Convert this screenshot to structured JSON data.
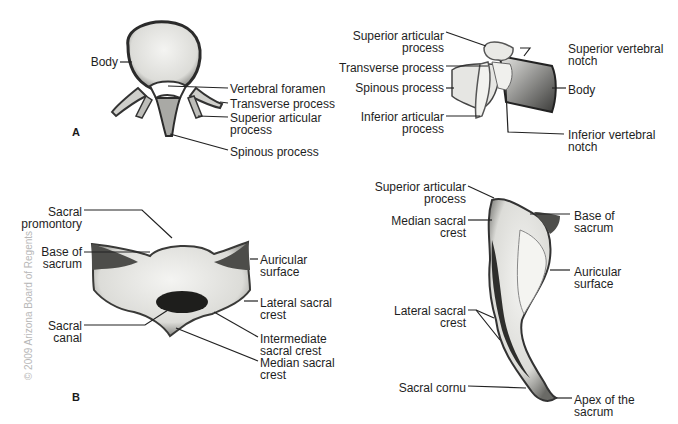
{
  "copyright": "© 2009 Arizona Board of Regents",
  "panels": {
    "a": "A",
    "b": "B"
  },
  "vertebra_superior": {
    "labels": [
      "Body",
      "Vertebral foramen",
      "Transverse process",
      "Superior articular",
      "process",
      "Spinous process"
    ]
  },
  "vertebra_lateral": {
    "labels": [
      "Superior articular",
      "process",
      "Transverse process",
      "Spinous process",
      "Inferior articular",
      "process",
      "Superior vertebral",
      "notch",
      "Body",
      "Inferior vertebral",
      "notch"
    ]
  },
  "sacrum_anterior": {
    "labels": [
      "Sacral",
      "promontory",
      "Base of",
      "sacrum",
      "Sacral",
      "canal",
      "Auricular",
      "surface",
      "Lateral sacral",
      "crest",
      "Intermediate",
      "sacral crest",
      "Median sacral",
      "crest"
    ]
  },
  "sacrum_lateral": {
    "labels": [
      "Superior articular",
      "process",
      "Median sacral",
      "crest",
      "Lateral sacral",
      "crest",
      "Sacral cornu",
      "Base of",
      "sacrum",
      "Auricular",
      "surface",
      "Apex of the",
      "sacrum"
    ]
  }
}
